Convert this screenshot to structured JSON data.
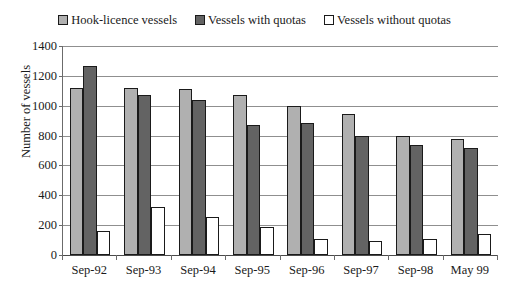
{
  "chart_data": {
    "type": "bar",
    "title": "",
    "xlabel": "",
    "ylabel": "Number of vessels",
    "ylim": [
      0,
      1400
    ],
    "yticks": [
      0,
      200,
      400,
      600,
      800,
      1000,
      1200,
      1400
    ],
    "ytick_labels": [
      "0",
      "200",
      "400",
      "600",
      "800",
      "1000",
      "1200",
      "1400"
    ],
    "grid": true,
    "legend_position": "top-center",
    "categories": [
      "Sep-92",
      "Sep-93",
      "Sep-94",
      "Sep-95",
      "Sep-96",
      "Sep-97",
      "Sep-98",
      "May 99"
    ],
    "series": [
      {
        "name": "Hook-licence vessels",
        "color": "#b0b0b0",
        "values": [
          1120,
          1120,
          1110,
          1070,
          1000,
          945,
          795,
          775
        ]
      },
      {
        "name": "Vessels with quotas",
        "color": "#636363",
        "values": [
          1265,
          1070,
          1040,
          870,
          885,
          800,
          740,
          715
        ]
      },
      {
        "name": "Vessels without quotas",
        "color": "#ffffff",
        "values": [
          160,
          320,
          255,
          185,
          105,
          95,
          110,
          140
        ]
      }
    ]
  },
  "axis": {
    "border_color": "#1a1a1a",
    "grid_color": "#8f8f8f"
  }
}
